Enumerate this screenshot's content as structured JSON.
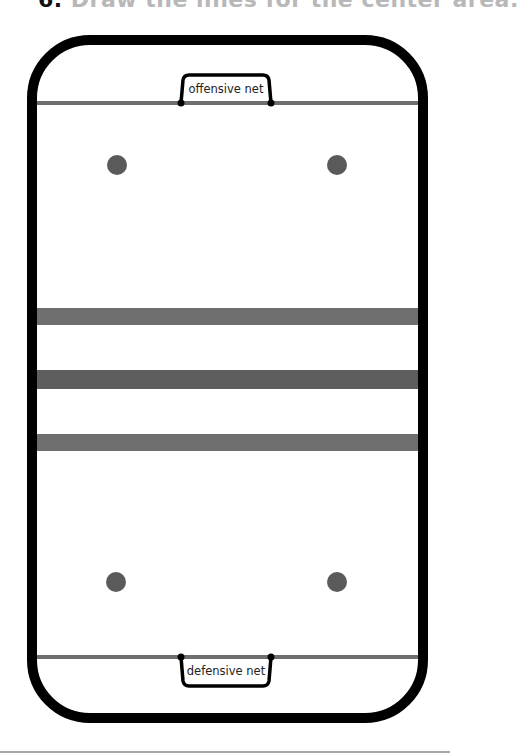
{
  "title": {
    "number": "6.",
    "text": "Draw the lines for the center area."
  },
  "diagram": {
    "type": "hockey-rink",
    "colors": {
      "boards": "#000000",
      "lines": "#6e6e6e",
      "center_line": "#5e5e5e",
      "faceoff_dots": "#5a5a5a",
      "ice": "#ffffff"
    },
    "offensive_net_label": "offensive net",
    "defensive_net_label": "defensive net",
    "center_lines": [
      "blue-line-top",
      "center-red-line",
      "blue-line-bottom"
    ],
    "faceoff_dots": [
      "top-left",
      "top-right",
      "bottom-left",
      "bottom-right"
    ]
  }
}
